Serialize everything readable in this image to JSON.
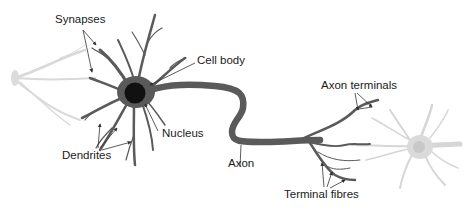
{
  "diagram": {
    "labels": {
      "synapses": "Synapses",
      "cell_body": "Cell body",
      "nucleus": "Nucleus",
      "dendrites": "Dendrites",
      "axon": "Axon",
      "axon_terminals": "Axon terminals",
      "terminal_fibres": "Terminal fibres"
    },
    "colors": {
      "neuron": "#5a5a5a",
      "nucleus": "#111111",
      "faded_neuron": "#d6d6d6",
      "leader_line": "#333333",
      "text": "#1a1a1a",
      "background": "#ffffff"
    }
  }
}
